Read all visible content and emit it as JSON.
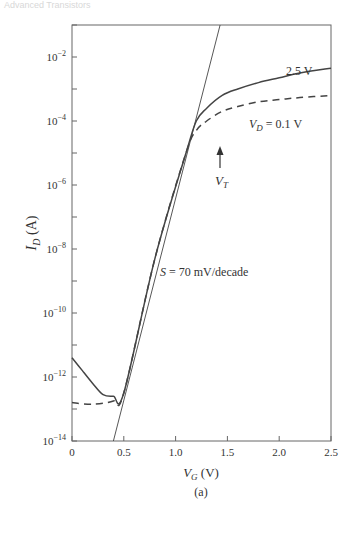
{
  "page": {
    "running_head": "Advanced Transistors"
  },
  "chart_data": {
    "type": "line",
    "title": "",
    "caption": "(a)",
    "xlabel": "V_G (V)",
    "ylabel": "I_D (A)",
    "xscale": "linear",
    "yscale": "log",
    "xlim": [
      0,
      2.5
    ],
    "ylim": [
      1e-14,
      0.1
    ],
    "x_ticks": [
      0,
      0.5,
      1.0,
      1.5,
      2.0,
      2.5
    ],
    "x_tick_labels": [
      "0",
      "0.5",
      "1.0",
      "1.5",
      "2.0",
      "2.5"
    ],
    "y_ticks_log10": [
      -14,
      -12,
      -10,
      -8,
      -6,
      -4,
      -2
    ],
    "y_tick_labels": [
      "10^-14",
      "10^-12",
      "10^-10",
      "10^-8",
      "10^-6",
      "10^-4",
      "10^-2"
    ],
    "y_minor_ticks_log10": [
      -13,
      -11,
      -9,
      -7,
      -5,
      -3,
      -1
    ],
    "grid": false,
    "legend": "inline labels",
    "series": [
      {
        "name": "V_D = 2.5 V",
        "label": "2.5 V",
        "style": "solid",
        "x": [
          0.0,
          0.1,
          0.2,
          0.3,
          0.4,
          0.5,
          0.8,
          1.1,
          1.2,
          1.3,
          1.45,
          1.6,
          1.8,
          2.0,
          2.2,
          2.5
        ],
        "log10_y": [
          -11.4,
          -11.8,
          -12.2,
          -12.55,
          -12.6,
          -12.5,
          -8.3,
          -5.0,
          -4.0,
          -3.6,
          -3.2,
          -3.0,
          -2.8,
          -2.65,
          -2.5,
          -2.35
        ]
      },
      {
        "name": "V_D = 0.1 V",
        "label": "V_D = 0.1 V",
        "style": "dashed",
        "x": [
          0.0,
          0.2,
          0.4,
          0.5,
          0.8,
          1.1,
          1.2,
          1.3,
          1.45,
          1.6,
          1.8,
          2.0,
          2.2,
          2.5
        ],
        "log10_y": [
          -12.8,
          -12.85,
          -12.75,
          -12.5,
          -8.3,
          -5.0,
          -4.3,
          -4.0,
          -3.7,
          -3.55,
          -3.4,
          -3.33,
          -3.27,
          -3.2
        ]
      },
      {
        "name": "subthreshold slope tangent",
        "style": "thin-solid",
        "x": [
          0.4,
          1.43
        ],
        "log10_y": [
          -14,
          -1.0
        ]
      }
    ],
    "annotations": [
      {
        "text": "S = 70 mV/decade",
        "x": 0.6,
        "log10_y": -8.6
      },
      {
        "text": "2.5 V",
        "x": 2.05,
        "log10_y": -2.2
      },
      {
        "text": "V_D = 0.1 V",
        "x": 1.7,
        "log10_y": -4.0
      },
      {
        "text": "V_T",
        "x": 1.4,
        "log10_y": -5.9,
        "arrow": {
          "from_log10": -5.2,
          "to_log10": -4.4
        }
      }
    ]
  },
  "labels": {
    "ylabel_main": "I",
    "ylabel_sub": "D",
    "ylabel_unit": " (A)",
    "xlabel_main": "V",
    "xlabel_sub": "G",
    "xlabel_unit": " (V)",
    "caption": "(a)",
    "slope": "S = 70 mV/decade",
    "curve_high": "2.5 V",
    "curve_low_main": "V",
    "curve_low_sub": "D",
    "curve_low_rest": " = 0.1 V",
    "vt_main": "V",
    "vt_sub": "T",
    "ytick_base": "10",
    "yticks": [
      "−14",
      "−12",
      "−10",
      "−8",
      "−6",
      "−4",
      "−2"
    ],
    "xticks": [
      "0",
      "0.5",
      "1.0",
      "1.5",
      "2.0",
      "2.5"
    ]
  },
  "colors": {
    "axis": "#555555",
    "curve": "#444444",
    "text": "#333333"
  }
}
